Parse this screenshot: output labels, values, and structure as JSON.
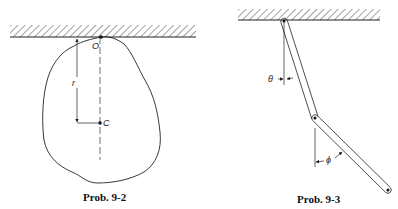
{
  "figures": [
    {
      "id": "prob-9-2",
      "caption": "Prob. 9-2",
      "labels": {
        "pivot": "O",
        "center": "C",
        "distance": "r"
      }
    },
    {
      "id": "prob-9-3",
      "caption": "Prob. 9-3",
      "labels": {
        "angle_upper": "θ",
        "angle_lower": "ϕ"
      }
    }
  ],
  "colors": {
    "ink": "#222222",
    "background": "#ffffff"
  }
}
